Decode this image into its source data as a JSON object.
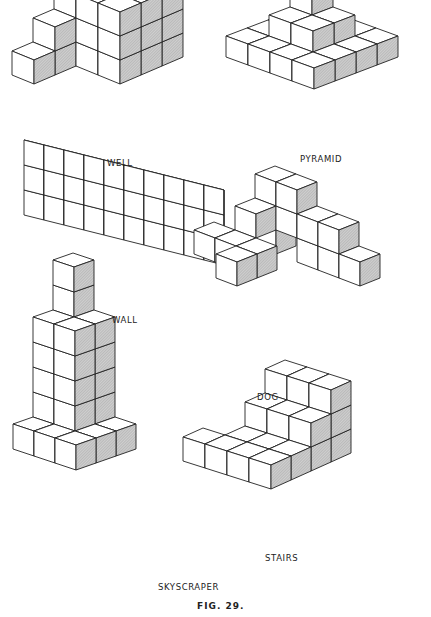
{
  "figure": {
    "caption": "FIG. 29.",
    "structures": [
      {
        "id": "well",
        "label": "WELL"
      },
      {
        "id": "pyramid",
        "label": "PYRAMID"
      },
      {
        "id": "wall",
        "label": "WALL"
      },
      {
        "id": "dog",
        "label": "DOG"
      },
      {
        "id": "skyscraper",
        "label": "SKYSCRAPER"
      },
      {
        "id": "stairs",
        "label": "STAIRS"
      }
    ]
  },
  "colors": {
    "line": "#222222",
    "shade": "#bfbfbf",
    "background": "#ffffff"
  }
}
